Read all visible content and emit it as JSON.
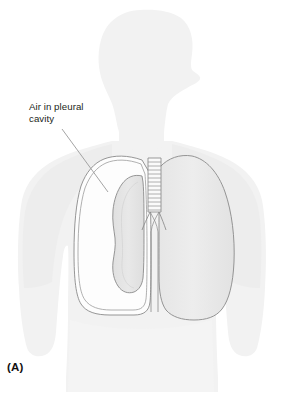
{
  "figure": {
    "panel_label": "(A)",
    "background_color": "#ffffff",
    "annotations": [
      {
        "id": "air-in-pleural-cavity",
        "text": "Air in pleural\ncavity",
        "text_color": "#231f20",
        "leader_line_color": "#9a9a9a"
      }
    ],
    "body": {
      "silhouette_label": "human torso and head, profile facing right",
      "fill_color": "#f2f2f2",
      "shadow_color": "#ededed"
    },
    "anatomy": {
      "pleural_cavity": {
        "label": "pleural cavity with air (pneumothorax)",
        "outline_color": "#8a8a8a",
        "fill_color": "#fdfdfd"
      },
      "collapsed_lung": {
        "label": "collapsed lung",
        "outline_color": "#8a8a8a",
        "fill_color": "#e3e3e3"
      },
      "normal_lung": {
        "label": "normal expanded lung",
        "outline_color": "#8a8a8a",
        "fill_color": "#ececec"
      },
      "trachea": {
        "label": "trachea with cartilage rings",
        "outline_color": "#8a8a8a",
        "ring_count": 13
      },
      "bronchi": {
        "label": "main bronchi",
        "outline_color": "#8a8a8a"
      }
    }
  }
}
